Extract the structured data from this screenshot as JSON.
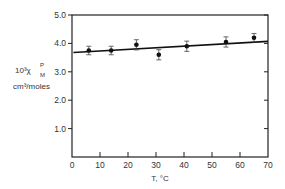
{
  "chart_data": {
    "type": "scatter",
    "title": "",
    "xlabel": "T, °C",
    "ylabel_line1": "10³χ",
    "ylabel_sup": "P",
    "ylabel_sub": "M",
    "ylabel_line2": "cm³/moles",
    "xlim": [
      0,
      70
    ],
    "ylim": [
      0,
      5.0
    ],
    "x_ticks": [
      0,
      10,
      20,
      30,
      40,
      50,
      60,
      70
    ],
    "x_tick_labels": [
      "0",
      "10",
      "20",
      "30",
      "40",
      "50",
      "60",
      "70"
    ],
    "y_ticks": [
      1.0,
      2.0,
      3.0,
      4.0,
      5.0
    ],
    "y_tick_labels": [
      "1.0",
      "2.0",
      "3.0",
      "4.0",
      "5.0"
    ],
    "grid": false,
    "legend": null,
    "series": [
      {
        "name": "measured",
        "marker": "filled-circle",
        "x": [
          6,
          14,
          23,
          31,
          41,
          55,
          65
        ],
        "y": [
          3.75,
          3.75,
          3.95,
          3.6,
          3.9,
          4.05,
          4.2
        ],
        "error": [
          0.15,
          0.15,
          0.18,
          0.18,
          0.18,
          0.18,
          0.15
        ]
      },
      {
        "name": "linear fit",
        "type": "line",
        "x": [
          0.5,
          70
        ],
        "y": [
          3.68,
          4.07
        ]
      }
    ]
  }
}
